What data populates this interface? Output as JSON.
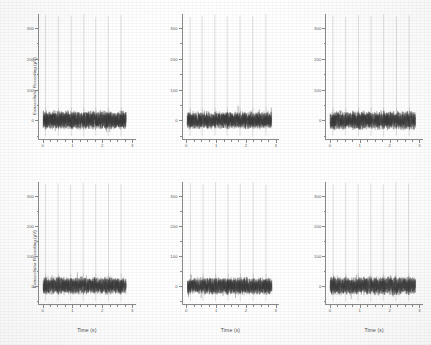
{
  "figure": {
    "panel_count": 6,
    "rows": 2,
    "cols": 3
  },
  "axis": {
    "ylabel": "Extracellular Recording (µV)",
    "xlabel": "Time (s)",
    "y_ticks": [
      "0",
      "100",
      "200",
      "300"
    ],
    "y_tick_values": [
      0,
      100,
      200,
      300
    ],
    "x_ticks": [
      "0",
      "1",
      "2",
      "3"
    ],
    "x_tick_values": [
      0,
      1,
      2,
      3
    ],
    "ylim": [
      -60,
      345
    ],
    "xlim": [
      -0.12,
      3.12
    ],
    "trace_color": "#3a3a3a",
    "axis_color": "#8a8a8a",
    "tick_label_color": "#5d5d5d"
  },
  "chart_data": {
    "type": "line",
    "title": "",
    "xlabel": "Time (s)",
    "ylabel": "Extracellular Recording (µV)",
    "xlim": [
      -0.12,
      3.12
    ],
    "ylim": [
      -60,
      345
    ],
    "grid": false,
    "legend": "none",
    "panels": [
      {
        "id": "panel-top-left",
        "row": 1,
        "col": 1,
        "show_ylabel": true,
        "show_xlabel": false,
        "noise_band_uv": [
          -32,
          34
        ],
        "spike_times_s": [
          0.1,
          0.53,
          0.96,
          1.38,
          1.78,
          2.2,
          2.63
        ],
        "spike_peak_uv": [
          342,
          338,
          340,
          345,
          336,
          339,
          341
        ],
        "spike_trough_uv": [
          -52,
          -50,
          -51,
          -53,
          -49,
          -50,
          -52
        ],
        "signal_start_s": 0.02,
        "signal_end_s": 2.8,
        "spike_count": 7
      },
      {
        "id": "panel-top-middle",
        "row": 1,
        "col": 2,
        "show_ylabel": false,
        "show_xlabel": false,
        "noise_band_uv": [
          -30,
          32
        ],
        "spike_times_s": [
          0.12,
          0.52,
          0.95,
          1.36,
          1.79,
          2.22,
          2.66
        ],
        "spike_peak_uv": [
          335,
          340,
          343,
          337,
          341,
          338,
          344
        ],
        "spike_trough_uv": [
          -50,
          -52,
          -49,
          -51,
          -50,
          -53,
          -51
        ],
        "signal_start_s": 0.02,
        "signal_end_s": 2.85,
        "spike_count": 7
      },
      {
        "id": "panel-top-right",
        "row": 1,
        "col": 3,
        "show_ylabel": false,
        "show_xlabel": false,
        "noise_band_uv": [
          -33,
          33
        ],
        "spike_times_s": [
          0.11,
          0.54,
          0.97,
          1.39,
          1.81,
          2.24,
          2.67
        ],
        "spike_peak_uv": [
          340,
          336,
          342,
          339,
          344,
          337,
          341
        ],
        "spike_trough_uv": [
          -51,
          -49,
          -52,
          -50,
          -53,
          -50,
          -51
        ],
        "signal_start_s": 0.02,
        "signal_end_s": 2.88,
        "spike_count": 7
      },
      {
        "id": "panel-bottom-left",
        "row": 2,
        "col": 1,
        "show_ylabel": true,
        "show_xlabel": true,
        "noise_band_uv": [
          -31,
          33
        ],
        "spike_times_s": [
          0.1,
          0.52,
          0.94,
          1.36,
          1.78,
          2.21,
          2.63
        ],
        "spike_peak_uv": [
          338,
          341,
          336,
          343,
          339,
          340,
          337
        ],
        "spike_trough_uv": [
          -50,
          -51,
          -49,
          -52,
          -50,
          -51,
          -53
        ],
        "signal_start_s": 0.02,
        "signal_end_s": 2.8,
        "spike_count": 7
      },
      {
        "id": "panel-bottom-middle",
        "row": 2,
        "col": 2,
        "show_ylabel": false,
        "show_xlabel": true,
        "noise_band_uv": [
          -32,
          31
        ],
        "spike_times_s": [
          0.13,
          0.55,
          0.97,
          1.39,
          1.8,
          2.23,
          2.66
        ],
        "spike_peak_uv": [
          342,
          337,
          344,
          338,
          340,
          343,
          336
        ],
        "spike_trough_uv": [
          -52,
          -50,
          -51,
          -49,
          -52,
          -50,
          -51
        ],
        "signal_start_s": 0.03,
        "signal_end_s": 2.86,
        "spike_count": 7
      },
      {
        "id": "panel-bottom-right",
        "row": 2,
        "col": 3,
        "show_ylabel": false,
        "show_xlabel": true,
        "noise_band_uv": [
          -33,
          34
        ],
        "spike_times_s": [
          0.12,
          0.54,
          0.96,
          1.38,
          1.8,
          2.22,
          2.65
        ],
        "spike_peak_uv": [
          336,
          343,
          339,
          341,
          337,
          344,
          340
        ],
        "spike_trough_uv": [
          -51,
          -52,
          -50,
          -53,
          -49,
          -51,
          -50
        ],
        "signal_start_s": 0.02,
        "signal_end_s": 2.88,
        "spike_count": 7
      }
    ]
  }
}
